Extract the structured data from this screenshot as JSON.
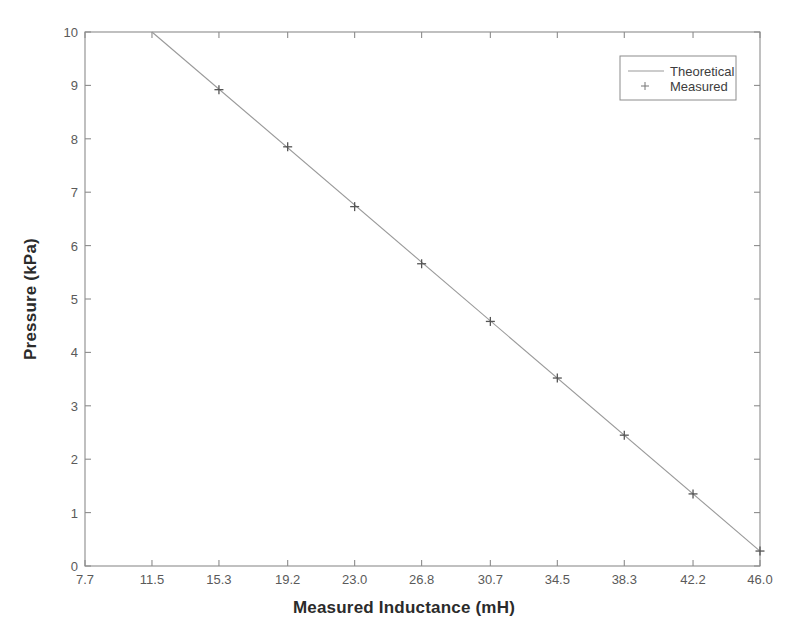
{
  "chart_data": {
    "type": "line",
    "title": "",
    "xlabel": "Measured Inductance (mH)",
    "ylabel": "Pressure (kPa)",
    "xlim": [
      7.7,
      46.0
    ],
    "ylim": [
      0,
      10
    ],
    "grid": false,
    "legend_position": "upper-right",
    "xticks": [
      7.7,
      11.5,
      15.3,
      19.2,
      23.0,
      26.8,
      30.7,
      34.5,
      38.3,
      42.2,
      46.0
    ],
    "xtick_labels": [
      "7.7",
      "11.5",
      "15.3",
      "19.2",
      "23.0",
      "26.8",
      "30.7",
      "34.5",
      "38.3",
      "42.2",
      "46.0"
    ],
    "yticks": [
      0,
      1,
      2,
      3,
      4,
      5,
      6,
      7,
      8,
      9,
      10
    ],
    "ytick_labels": [
      "0",
      "1",
      "2",
      "3",
      "4",
      "5",
      "6",
      "7",
      "8",
      "9",
      "10"
    ],
    "series": [
      {
        "name": "Theoretical",
        "style": "line",
        "color": "#999999",
        "x": [
          11.5,
          46.0
        ],
        "values": [
          10.0,
          0.28
        ]
      },
      {
        "name": "Measured",
        "style": "marker",
        "marker": "+",
        "color": "#555555",
        "x": [
          15.3,
          19.2,
          23.0,
          26.8,
          30.7,
          34.5,
          38.3,
          42.2,
          46.0
        ],
        "values": [
          8.92,
          7.85,
          6.73,
          5.66,
          4.58,
          3.52,
          2.45,
          1.35,
          0.28
        ]
      }
    ]
  },
  "legend": {
    "entries": [
      {
        "label": "Theoretical",
        "swatch": "line-swatch"
      },
      {
        "label": "Measured",
        "swatch": "plus-marker-swatch"
      }
    ]
  },
  "colors": {
    "axis": "#8c8c8c",
    "line": "#999999",
    "marker": "#555555",
    "text": "#2b2b2b",
    "tick_text": "#5a5a5a",
    "background": "#ffffff"
  }
}
